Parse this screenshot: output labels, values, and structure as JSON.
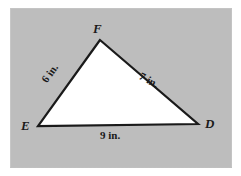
{
  "figure": {
    "shape": "triangle",
    "background_color": "#bdbdbd",
    "fill_color": "#ffffff",
    "stroke_color": "#1a1a1a",
    "vertices": [
      {
        "id": "F",
        "label": "F",
        "x": 100,
        "y": 40
      },
      {
        "id": "E",
        "label": "E",
        "x": 38,
        "y": 126
      },
      {
        "id": "D",
        "label": "D",
        "x": 198,
        "y": 124
      }
    ],
    "sides": [
      {
        "id": "EF",
        "label": "6 in.",
        "value": 6,
        "unit": "in."
      },
      {
        "id": "FD",
        "label": "7 in.",
        "value": 7,
        "unit": "in."
      },
      {
        "id": "ED",
        "label": "9 in.",
        "value": 9,
        "unit": "in."
      }
    ]
  }
}
